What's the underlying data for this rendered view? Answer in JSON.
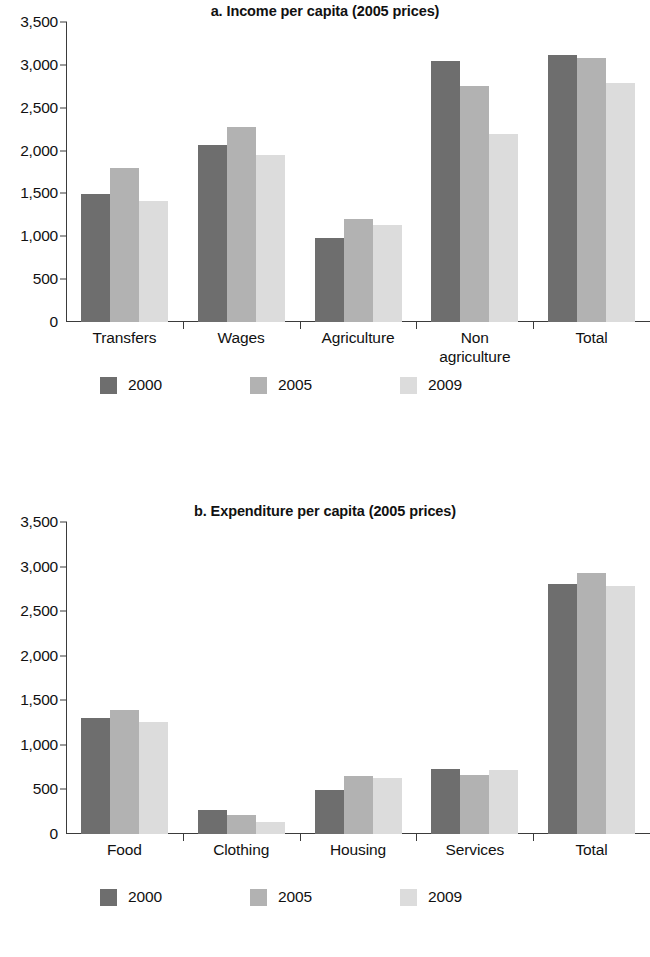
{
  "series_colors": {
    "2000": "#6e6e6e",
    "2005": "#b2b2b2",
    "2009": "#dcdcdc"
  },
  "panel_a": {
    "title": "a. Income per capita (2005 prices)",
    "legend": [
      {
        "label": "2000",
        "color": "#6e6e6e"
      },
      {
        "label": "2005",
        "color": "#b2b2b2"
      },
      {
        "label": "2009",
        "color": "#dcdcdc"
      }
    ]
  },
  "panel_b": {
    "title": "b. Expenditure per capita (2005 prices)",
    "legend": [
      {
        "label": "2000",
        "color": "#6e6e6e"
      },
      {
        "label": "2005",
        "color": "#b2b2b2"
      },
      {
        "label": "2009",
        "color": "#dcdcdc"
      }
    ]
  },
  "chart_data": [
    {
      "type": "bar",
      "title": "a. Income per capita (2005 prices)",
      "xlabel": "",
      "ylabel": "",
      "ylim": [
        0,
        3500
      ],
      "yticks": [
        0,
        500,
        1000,
        1500,
        2000,
        2500,
        3000,
        3500
      ],
      "ytick_labels": [
        "0",
        "500",
        "1,000",
        "1,500",
        "2,000",
        "2,500",
        "3,000",
        "3,500"
      ],
      "grid": false,
      "legend_position": "bottom",
      "categories": [
        "Transfers",
        "Wages",
        "Agriculture",
        "Non agriculture",
        "Total"
      ],
      "series": [
        {
          "name": "2000",
          "color": "#6e6e6e",
          "values": [
            1490,
            2070,
            980,
            3050,
            3120
          ]
        },
        {
          "name": "2005",
          "color": "#b2b2b2",
          "values": [
            1800,
            2280,
            1200,
            2750,
            3080
          ]
        },
        {
          "name": "2009",
          "color": "#dcdcdc",
          "values": [
            1410,
            1950,
            1130,
            2190,
            2790
          ]
        }
      ]
    },
    {
      "type": "bar",
      "title": "b. Expenditure per capita (2005 prices)",
      "xlabel": "",
      "ylabel": "",
      "ylim": [
        0,
        3500
      ],
      "yticks": [
        0,
        500,
        1000,
        1500,
        2000,
        2500,
        3000,
        3500
      ],
      "ytick_labels": [
        "0",
        "500",
        "1,000",
        "1,500",
        "2,000",
        "2,500",
        "3,000",
        "3,500"
      ],
      "grid": false,
      "legend_position": "bottom",
      "categories": [
        "Food",
        "Clothing",
        "Housing",
        "Services",
        "Total"
      ],
      "series": [
        {
          "name": "2000",
          "color": "#6e6e6e",
          "values": [
            1300,
            270,
            490,
            730,
            2800
          ]
        },
        {
          "name": "2005",
          "color": "#b2b2b2",
          "values": [
            1390,
            210,
            650,
            660,
            2930
          ]
        },
        {
          "name": "2009",
          "color": "#dcdcdc",
          "values": [
            1260,
            130,
            630,
            720,
            2780
          ]
        }
      ]
    }
  ]
}
